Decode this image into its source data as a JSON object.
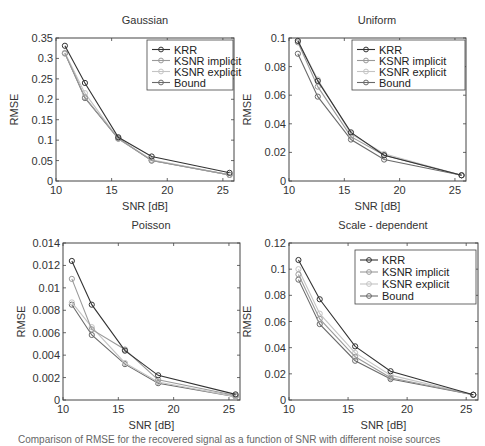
{
  "figure": {
    "caption": "Comparison of RMSE for the recovered signal as a function of SNR with different noise sources",
    "series_styles": [
      {
        "name": "KRR",
        "color": "#333333"
      },
      {
        "name": "KSNR implicit",
        "color": "#9a9a9a"
      },
      {
        "name": "KSNR explicit",
        "color": "#c4c4c4"
      },
      {
        "name": "Bound",
        "color": "#6a6a6a"
      }
    ]
  },
  "chart_data": [
    {
      "type": "line",
      "title": "Gaussian",
      "xlabel": "SNR [dB]",
      "ylabel": "RMSE",
      "x": [
        10.8,
        12.6,
        15.6,
        18.6,
        25.6
      ],
      "xlim": [
        10,
        26
      ],
      "ylim": [
        0,
        0.35
      ],
      "xticks": [
        10,
        15,
        20,
        25
      ],
      "yticks": [
        0,
        0.05,
        0.1,
        0.15,
        0.2,
        0.25,
        0.3,
        0.35
      ],
      "ytick_labels": [
        "0",
        "0.05",
        "0.1",
        "0.15",
        "0.2",
        "0.25",
        "0.3",
        "0.35"
      ],
      "legend": true,
      "legend_position": "upper right",
      "series": [
        {
          "name": "KRR",
          "values": [
            0.331,
            0.24,
            0.107,
            0.06,
            0.02
          ]
        },
        {
          "name": "KSNR implicit",
          "values": [
            0.312,
            0.205,
            0.104,
            0.05,
            0.015
          ]
        },
        {
          "name": "KSNR explicit",
          "values": [
            0.314,
            0.215,
            0.103,
            0.052,
            0.015
          ]
        },
        {
          "name": "Bound",
          "values": [
            0.313,
            0.203,
            0.104,
            0.05,
            0.015
          ]
        }
      ]
    },
    {
      "type": "line",
      "title": "Uniform",
      "xlabel": "SNR [dB]",
      "ylabel": "RMSE",
      "x": [
        10.8,
        12.6,
        15.6,
        18.6,
        25.6
      ],
      "xlim": [
        10,
        26
      ],
      "ylim": [
        0,
        0.1
      ],
      "xticks": [
        10,
        15,
        20,
        25
      ],
      "yticks": [
        0,
        0.02,
        0.04,
        0.06,
        0.08,
        0.1
      ],
      "ytick_labels": [
        "0",
        "0.02",
        "0.04",
        "0.06",
        "0.08",
        "0.1"
      ],
      "legend": true,
      "legend_position": "upper right",
      "series": [
        {
          "name": "KRR",
          "values": [
            0.098,
            0.07,
            0.034,
            0.018,
            0.004
          ]
        },
        {
          "name": "KSNR implicit",
          "values": [
            0.097,
            0.066,
            0.031,
            0.018,
            0.004
          ]
        },
        {
          "name": "KSNR explicit",
          "values": [
            0.098,
            0.071,
            0.033,
            0.019,
            0.004
          ]
        },
        {
          "name": "Bound",
          "values": [
            0.089,
            0.059,
            0.029,
            0.015,
            0.004
          ]
        }
      ]
    },
    {
      "type": "line",
      "title": "Poisson",
      "xlabel": "SNR [dB]",
      "ylabel": "RMSE",
      "x": [
        10.8,
        12.6,
        15.6,
        18.6,
        25.6
      ],
      "xlim": [
        10,
        26
      ],
      "ylim": [
        0,
        0.014
      ],
      "xticks": [
        10,
        15,
        20,
        25
      ],
      "yticks": [
        0,
        0.002,
        0.004,
        0.006,
        0.008,
        0.01,
        0.012,
        0.014
      ],
      "ytick_labels": [
        "0",
        "0.002",
        "0.004",
        "0.006",
        "0.008",
        "0.01",
        "0.012",
        "0.014"
      ],
      "legend": false,
      "series": [
        {
          "name": "KRR",
          "values": [
            0.0124,
            0.0085,
            0.0044,
            0.0022,
            0.0005
          ]
        },
        {
          "name": "KSNR implicit",
          "values": [
            0.0108,
            0.0063,
            0.0045,
            0.0018,
            0.0004
          ]
        },
        {
          "name": "KSNR explicit",
          "values": [
            0.0087,
            0.0065,
            0.0033,
            0.0016,
            0.0003
          ]
        },
        {
          "name": "Bound",
          "values": [
            0.0085,
            0.0058,
            0.0032,
            0.0015,
            0.0003
          ]
        }
      ]
    },
    {
      "type": "line",
      "title": "Scale - dependent",
      "xlabel": "SNR [dB]",
      "ylabel": "RMSE",
      "x": [
        10.8,
        12.6,
        15.6,
        18.6,
        25.6
      ],
      "xlim": [
        10,
        26
      ],
      "ylim": [
        0,
        0.12
      ],
      "xticks": [
        10,
        15,
        20,
        25
      ],
      "yticks": [
        0,
        0.02,
        0.04,
        0.06,
        0.08,
        0.1,
        0.12
      ],
      "ytick_labels": [
        "0",
        "0.02",
        "0.04",
        "0.06",
        "0.08",
        "0.1",
        "0.12"
      ],
      "legend": true,
      "legend_position": "upper right",
      "series": [
        {
          "name": "KRR",
          "values": [
            0.107,
            0.077,
            0.041,
            0.022,
            0.004
          ]
        },
        {
          "name": "KSNR implicit",
          "values": [
            0.096,
            0.062,
            0.033,
            0.017,
            0.004
          ]
        },
        {
          "name": "KSNR explicit",
          "values": [
            0.1,
            0.066,
            0.036,
            0.019,
            0.004
          ]
        },
        {
          "name": "Bound",
          "values": [
            0.092,
            0.058,
            0.03,
            0.016,
            0.004
          ]
        }
      ]
    }
  ]
}
